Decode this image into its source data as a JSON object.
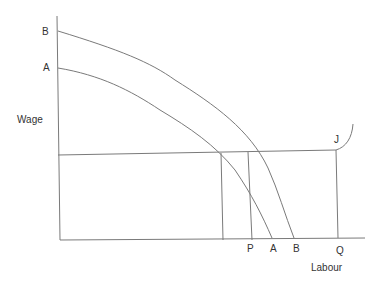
{
  "axes": {
    "y_label": "Wage",
    "x_label": "Labour"
  },
  "curves": {
    "upper_label": "B",
    "lower_label": "A"
  },
  "x_markers": {
    "p": "P",
    "a": "A",
    "b": "B",
    "q": "Q"
  },
  "supply_point_label": "J",
  "colors": {
    "line": "#7a7a7a",
    "text": "#333333"
  }
}
